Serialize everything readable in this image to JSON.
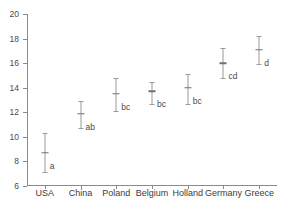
{
  "chart_data": {
    "type": "scatter",
    "title": "",
    "subtitle": "",
    "xlabel": "",
    "ylabel": "",
    "categories": [
      "USA",
      "China",
      "Poland",
      "Belgium",
      "Holland",
      "Germany",
      "Greece"
    ],
    "values": [
      8.7,
      11.9,
      13.5,
      13.7,
      14.0,
      16.0,
      17.1
    ],
    "error_low": [
      7.1,
      10.7,
      12.1,
      12.7,
      12.7,
      14.8,
      15.9
    ],
    "error_high": [
      10.3,
      12.9,
      14.8,
      14.5,
      15.1,
      17.2,
      18.2
    ],
    "annotations": [
      "a",
      "ab",
      "bc",
      "bc",
      "bc",
      "cd",
      "d"
    ],
    "ylim": [
      6,
      20
    ],
    "yticks": [
      6,
      8,
      10,
      12,
      14,
      16,
      18,
      20
    ],
    "ytick_labels": [
      "6",
      "8",
      "10",
      "12",
      "14",
      "16",
      "18",
      "20"
    ],
    "grid": false,
    "legend": "none",
    "series": [
      {
        "name": "mean with 95% interval",
        "points": [
          {
            "category": "USA",
            "mean": 8.7,
            "low": 7.1,
            "high": 10.3,
            "letter": "a"
          },
          {
            "category": "China",
            "mean": 11.9,
            "low": 10.7,
            "high": 12.9,
            "letter": "ab"
          },
          {
            "category": "Poland",
            "mean": 13.5,
            "low": 12.1,
            "high": 14.8,
            "letter": "bc"
          },
          {
            "category": "Belgium",
            "mean": 13.7,
            "low": 12.7,
            "high": 14.5,
            "letter": "bc"
          },
          {
            "category": "Holland",
            "mean": 14.0,
            "low": 12.7,
            "high": 15.1,
            "letter": "bc"
          },
          {
            "category": "Germany",
            "mean": 16.0,
            "low": 14.8,
            "high": 17.2,
            "letter": "cd"
          },
          {
            "category": "Greece",
            "mean": 17.1,
            "low": 15.9,
            "high": 18.2,
            "letter": "d"
          }
        ]
      }
    ],
    "colors": {
      "axis": "#8a8a8a",
      "whisker": "#9a9a9a",
      "mean": "#707070",
      "text": "#4a4a4a",
      "background": "#ffffff"
    }
  }
}
